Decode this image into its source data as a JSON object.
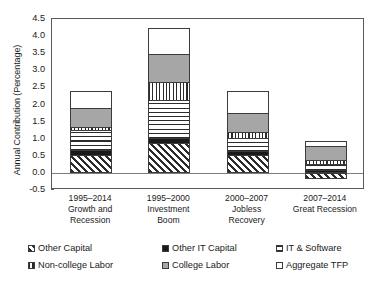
{
  "chart_data": {
    "type": "bar",
    "stacked": true,
    "title": "",
    "xlabel": "",
    "ylabel": "Annual Contribution (Percentage)",
    "ylim": [
      -0.5,
      4.5
    ],
    "ytick_step": 0.5,
    "yticks": [
      "4.5",
      "4.0",
      "3.5",
      "3.0",
      "2.5",
      "2.0",
      "1.5",
      "1.0",
      "0.5",
      "0.0",
      "-0.5"
    ],
    "grid": false,
    "legend_position": "bottom",
    "categories": [
      "1995–2014\nGrowth and\nRecession",
      "1995–2000\nInvestment\nBoom",
      "2000–2007\nJobless\nRecovery",
      "2007–2014\nGreat Recession"
    ],
    "series": [
      {
        "name": "Other Capital",
        "values": [
          0.53,
          0.86,
          0.53,
          -0.18
        ],
        "pattern": "diagonal-hatch"
      },
      {
        "name": "Other IT Capital",
        "values": [
          0.13,
          0.16,
          0.12,
          0.08
        ],
        "pattern": "solid-black"
      },
      {
        "name": "IT & Software",
        "values": [
          0.59,
          1.11,
          0.36,
          0.18
        ],
        "pattern": "horizontal-lines"
      },
      {
        "name": "Non-college Labor",
        "values": [
          0.1,
          0.53,
          0.18,
          0.13
        ],
        "pattern": "vertical-lines"
      },
      {
        "name": "College Labor",
        "values": [
          0.56,
          0.81,
          0.55,
          0.41
        ],
        "pattern": "solid-gray"
      },
      {
        "name": "Aggregate TFP",
        "values": [
          0.48,
          0.78,
          0.66,
          0.12
        ],
        "pattern": "solid-white"
      }
    ],
    "bar_totals": [
      "2.39",
      "4.25",
      "2.40",
      "0.92"
    ]
  },
  "legend": {
    "items": [
      {
        "label": "Other Capital",
        "swatch": "diagonal-hatch"
      },
      {
        "label": "Other IT Capital",
        "swatch": "solid-black"
      },
      {
        "label": "IT & Software",
        "swatch": "horizontal-lines"
      },
      {
        "label": "Non-college Labor",
        "swatch": "vertical-lines"
      },
      {
        "label": "College Labor",
        "swatch": "solid-gray"
      },
      {
        "label": "Aggregate TFP",
        "swatch": "solid-white"
      }
    ]
  },
  "colors": {
    "black": "#1a1a1a",
    "gray": "#a6a6a6",
    "white": "#ffffff",
    "axis": "#5a5a5a",
    "outline": "#3b3b3b"
  }
}
